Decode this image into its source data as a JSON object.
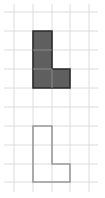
{
  "diagram": {
    "grid": {
      "columns_x": [
        14,
        33,
        52,
        70,
        89
      ],
      "rows_y": [
        12,
        31,
        50,
        69,
        88,
        107,
        126,
        145,
        164,
        182
      ],
      "x_range": [
        4,
        98
      ],
      "y_range": [
        4,
        192
      ],
      "line_color": "#dcdcdc"
    },
    "shapes": [
      {
        "name": "filled-l-shape",
        "fill": "#5f5f5f",
        "stroke": "#2a2a2a",
        "points": "33,31 52,31 52,69 70,69 70,88 33,88",
        "inner_lines": [
          [
            33,
            50,
            52,
            50
          ],
          [
            33,
            69,
            52,
            69
          ],
          [
            52,
            69,
            52,
            88
          ]
        ],
        "inner_line_color": "#8a8a8a"
      },
      {
        "name": "outlined-l-shape",
        "fill": "none",
        "stroke": "#9a9a9a",
        "points": "33,126 52,126 52,164 70,164 70,182 33,182"
      }
    ]
  }
}
